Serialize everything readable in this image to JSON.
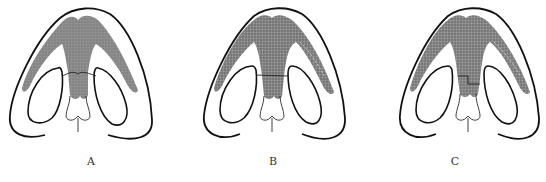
{
  "figure": {
    "panels": [
      {
        "id": "A",
        "label": "A",
        "variant": "a"
      },
      {
        "id": "B",
        "label": "B",
        "variant": "b"
      },
      {
        "id": "C",
        "label": "C",
        "variant": "c"
      }
    ],
    "colors": {
      "outline": "#111111",
      "cartilage_fill": "#8c8c8c",
      "cartilage_fill_dark": "#777777",
      "background": "#ffffff"
    }
  }
}
